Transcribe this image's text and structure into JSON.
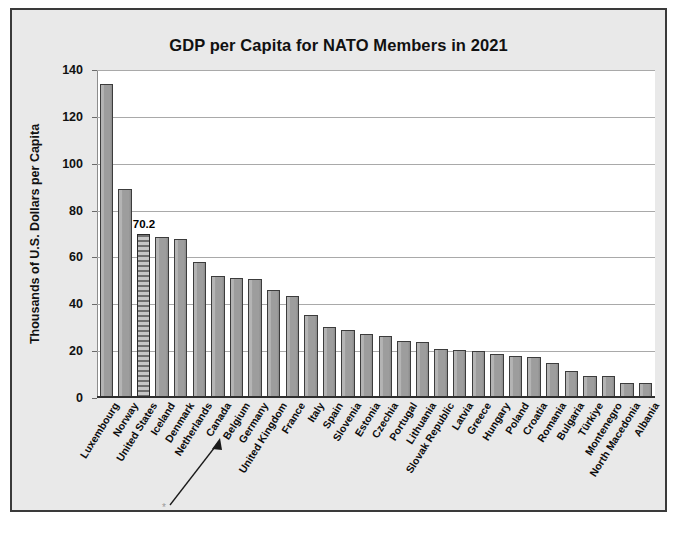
{
  "chart_data": {
    "type": "bar",
    "title": "GDP per Capita for NATO Members in 2021",
    "xlabel": "",
    "ylabel": "Thousands of U.S. Dollars per Capita",
    "ylim": [
      0,
      140
    ],
    "ytick_step": 20,
    "ytick_labels": [
      "0",
      "20",
      "40",
      "60",
      "80",
      "100",
      "120",
      "140"
    ],
    "grid": true,
    "legend": "none",
    "categories": [
      "Luxembourg",
      "Norway",
      "United States",
      "Iceland",
      "Denmark",
      "Netherlands",
      "Canada",
      "Belgium",
      "Germany",
      "United Kingdom",
      "France",
      "Italy",
      "Spain",
      "Slovenia",
      "Estonia",
      "Czechia",
      "Portugal",
      "Lithuania",
      "Slovak Republic",
      "Latvia",
      "Greece",
      "Hungary",
      "Poland",
      "Croatia",
      "Romania",
      "Bulgaria",
      "Türkiye",
      "Montenegro",
      "North Macedonia",
      "Albania"
    ],
    "values": [
      134.0,
      89.2,
      70.2,
      68.8,
      68.0,
      58.0,
      52.0,
      51.2,
      51.0,
      46.2,
      43.5,
      35.5,
      30.1,
      29.2,
      27.2,
      26.4,
      24.5,
      23.7,
      21.1,
      20.6,
      20.2,
      18.7,
      17.8,
      17.4,
      14.9,
      11.6,
      9.6,
      9.4,
      6.6,
      6.4
    ],
    "data_labels": [
      {
        "category": "United States",
        "value": "70.2"
      }
    ],
    "highlighted_category": "United States",
    "annotation": {
      "marker": "*",
      "arrow": "points up-right toward the Netherlands / Canada label"
    },
    "colors": {
      "bar_fill": "#9d9d9d",
      "bar_border": "#3c3c3c",
      "highlight_pattern": "#6f6f6f",
      "plot_background": "#ffffff",
      "frame_background": "#e9e9e9",
      "frame_border": "#3a3a3a",
      "gridline": "#a9a9a9",
      "text": "#111111"
    }
  }
}
